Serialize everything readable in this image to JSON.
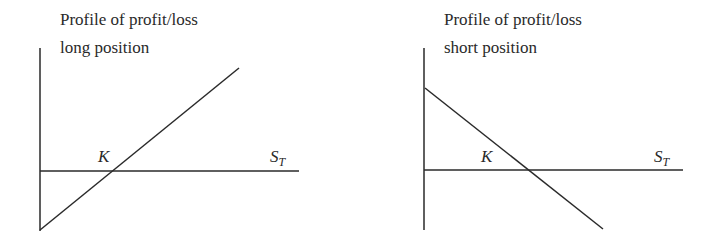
{
  "panels": [
    {
      "title_line1": "Profile of profit/loss",
      "title_line2": "long position",
      "strike_label": "K",
      "x_label_main": "S",
      "x_label_sub": "T",
      "slope": "positive"
    },
    {
      "title_line1": "Profile of profit/loss",
      "title_line2": "short position",
      "strike_label": "K",
      "x_label_main": "S",
      "x_label_sub": "T",
      "slope": "negative"
    }
  ],
  "colors": {
    "line": "#2a2a2a",
    "background": "#ffffff"
  }
}
